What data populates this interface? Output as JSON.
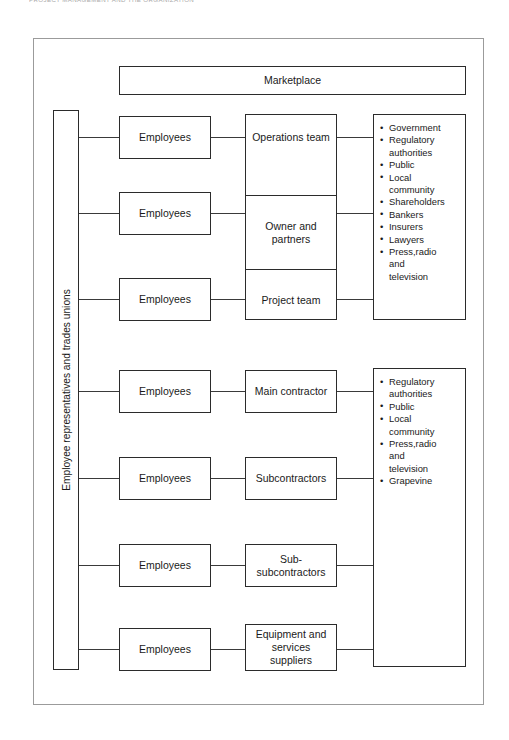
{
  "page": {
    "running_head": "Project management and the organization",
    "frame_label": "stakeholder-map-frame"
  },
  "diagram": {
    "marketplace_label": "Marketplace",
    "vertical_label": "Employee representatives and trades unions",
    "employees_label": "Employees",
    "employees_count": 7,
    "org_stack": [
      {
        "label": "Operations team",
        "align": "top"
      },
      {
        "label": "Owner and\npartners",
        "align": "middle"
      },
      {
        "label": "Project team",
        "align": "bottom"
      }
    ],
    "supply_chain": [
      {
        "label": "Main contractor"
      },
      {
        "label": "Subcontractors"
      },
      {
        "label": "Sub-\nsubcontractors"
      },
      {
        "label": "Equipment and\nservices\nsuppliers"
      }
    ],
    "stakeholder_groups": [
      {
        "name": "external-stakeholders-upper",
        "items": [
          "Government",
          "Regulatory\nauthorities",
          "Public",
          "Local\ncommunity",
          "Shareholders",
          "Bankers",
          "Insurers",
          "Lawyers",
          "Press,radio\nand\ntelevision"
        ]
      },
      {
        "name": "external-stakeholders-lower",
        "items": [
          "Regulatory\nauthorities",
          "Public",
          "Local\ncommunity",
          "Press,radio\nand\ntelevision",
          "Grapevine"
        ]
      }
    ]
  },
  "colors": {
    "box_border": "#2b2b2b",
    "frame_border": "#9b9b9b",
    "connector": "#3a3a3a",
    "text": "#1a1a1a",
    "background": "#ffffff"
  }
}
